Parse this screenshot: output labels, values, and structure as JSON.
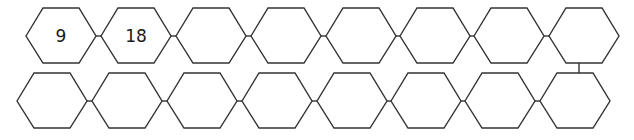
{
  "diagram": {
    "rows": [
      {
        "cells": [
          "9",
          "18",
          "",
          "",
          "",
          "",
          "",
          ""
        ]
      },
      {
        "cells": [
          "",
          "",
          "",
          "",
          "",
          "",
          "",
          ""
        ]
      }
    ],
    "colors": {
      "stroke": "#333333",
      "fill": "#ffffff"
    }
  }
}
